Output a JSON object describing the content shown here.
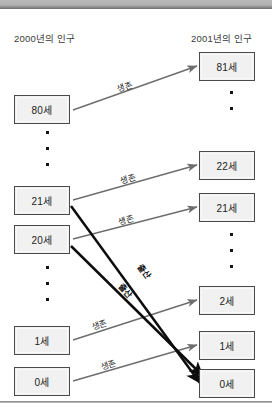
{
  "diagram": {
    "title_left": "2000년의 인구",
    "title_right": "2001년의 인구",
    "colors": {
      "box_fill": "#f1f1f1",
      "box_border": "#4a4a4a",
      "survival_arrow": "#6d6d6d",
      "birth_arrow": "#0d0d0d",
      "band": "#9a9a9a"
    },
    "left_column": {
      "label": "2000년의 인구",
      "boxes": [
        {
          "name": "age-80",
          "text": "80세"
        },
        {
          "name": "age-21",
          "text": "21세"
        },
        {
          "name": "age-20",
          "text": "20세"
        },
        {
          "name": "age-1",
          "text": "1세"
        },
        {
          "name": "age-0",
          "text": "0세"
        }
      ],
      "ellipsis_groups": [
        {
          "name": "left-ellipsis-upper",
          "dots": 3
        },
        {
          "name": "left-ellipsis-lower",
          "dots": 3
        }
      ]
    },
    "right_column": {
      "label": "2001년의 인구",
      "boxes": [
        {
          "name": "age-81",
          "text": "81세"
        },
        {
          "name": "age-22",
          "text": "22세"
        },
        {
          "name": "age-21",
          "text": "21세"
        },
        {
          "name": "age-2",
          "text": "2세"
        },
        {
          "name": "age-1",
          "text": "1세"
        },
        {
          "name": "age-0",
          "text": "0세"
        }
      ],
      "ellipsis_groups": [
        {
          "name": "right-ellipsis-upper",
          "dots": 2
        },
        {
          "name": "right-ellipsis-lower",
          "dots": 3
        }
      ]
    },
    "arrows": [
      {
        "name": "survival-80-to-81",
        "label": "생존",
        "type": "survival",
        "from": "80세",
        "to": "81세"
      },
      {
        "name": "survival-21-to-22",
        "label": "생존",
        "type": "survival",
        "from": "21세",
        "to": "22세"
      },
      {
        "name": "survival-20-to-21",
        "label": "생존",
        "type": "survival",
        "from": "20세",
        "to": "21세"
      },
      {
        "name": "survival-1-to-2",
        "label": "생존",
        "type": "survival",
        "from": "1세",
        "to": "2세"
      },
      {
        "name": "survival-0-to-1",
        "label": "생존",
        "type": "survival",
        "from": "0세",
        "to": "1세"
      },
      {
        "name": "birth-21-to-0",
        "label": "출산",
        "type": "birth",
        "from": "21세",
        "to": "0세"
      },
      {
        "name": "birth-20-to-0",
        "label": "출산",
        "type": "birth",
        "from": "20세",
        "to": "0세"
      }
    ]
  }
}
